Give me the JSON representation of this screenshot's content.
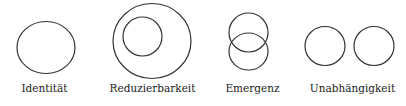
{
  "diagram": {
    "type": "set-relations",
    "panels": [
      {
        "id": "identity",
        "label": "Identität",
        "circles": 1,
        "relation": "single"
      },
      {
        "id": "reducibility",
        "label": "Reduzierbarkeit",
        "circles": 2,
        "relation": "nested"
      },
      {
        "id": "emergence",
        "label": "Emergenz",
        "circles": 2,
        "relation": "overlapping"
      },
      {
        "id": "independence",
        "label": "Unabhängigkeit",
        "circles": 2,
        "relation": "disjoint"
      }
    ],
    "colors": {
      "stroke": "#333333",
      "text": "#222222",
      "background": "#ffffff"
    }
  }
}
